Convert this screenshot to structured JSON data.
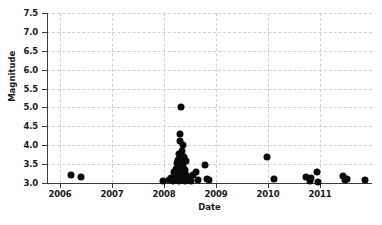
{
  "chart_data": {
    "type": "scatter",
    "title": "",
    "xlabel": "Date",
    "ylabel": "Magnitude",
    "xlim": [
      2005.75,
      2012.0
    ],
    "ylim": [
      3.0,
      7.5
    ],
    "grid": true,
    "legend": null,
    "marker": {
      "shape": "circle",
      "color": "#0a0a0a",
      "size_px": 7
    },
    "x_ticks": [
      {
        "value": 2006,
        "label": "2006"
      },
      {
        "value": 2007,
        "label": "2007"
      },
      {
        "value": 2008,
        "label": "2008"
      },
      {
        "value": 2009,
        "label": "2009"
      },
      {
        "value": 2010,
        "label": "2010"
      },
      {
        "value": 2011,
        "label": "2011"
      }
    ],
    "y_ticks": [
      {
        "value": 3.0,
        "label": "3.0"
      },
      {
        "value": 3.5,
        "label": "3.5"
      },
      {
        "value": 4.0,
        "label": "4.0"
      },
      {
        "value": 4.5,
        "label": "4.5"
      },
      {
        "value": 5.0,
        "label": "5.0"
      },
      {
        "value": 5.5,
        "label": "5.5"
      },
      {
        "value": 6.0,
        "label": "6.0"
      },
      {
        "value": 6.5,
        "label": "6.5"
      },
      {
        "value": 7.0,
        "label": "7.0"
      },
      {
        "value": 7.5,
        "label": "7.5"
      }
    ],
    "points": [
      {
        "x": 2006.22,
        "y": 3.21
      },
      {
        "x": 2006.41,
        "y": 3.17
      },
      {
        "x": 2007.98,
        "y": 3.06
      },
      {
        "x": 2008.09,
        "y": 3.09
      },
      {
        "x": 2008.14,
        "y": 3.12
      },
      {
        "x": 2008.18,
        "y": 3.05
      },
      {
        "x": 2008.2,
        "y": 3.3
      },
      {
        "x": 2008.21,
        "y": 3.18
      },
      {
        "x": 2008.22,
        "y": 3.1
      },
      {
        "x": 2008.23,
        "y": 3.38
      },
      {
        "x": 2008.24,
        "y": 3.07
      },
      {
        "x": 2008.25,
        "y": 3.25
      },
      {
        "x": 2008.25,
        "y": 3.52
      },
      {
        "x": 2008.26,
        "y": 3.14
      },
      {
        "x": 2008.27,
        "y": 3.33
      },
      {
        "x": 2008.27,
        "y": 3.62
      },
      {
        "x": 2008.28,
        "y": 3.06
      },
      {
        "x": 2008.28,
        "y": 3.2
      },
      {
        "x": 2008.29,
        "y": 3.45
      },
      {
        "x": 2008.29,
        "y": 3.78
      },
      {
        "x": 2008.3,
        "y": 3.11
      },
      {
        "x": 2008.3,
        "y": 3.28
      },
      {
        "x": 2008.3,
        "y": 3.55
      },
      {
        "x": 2008.31,
        "y": 4.31
      },
      {
        "x": 2008.31,
        "y": 4.12
      },
      {
        "x": 2008.31,
        "y": 3.16
      },
      {
        "x": 2008.32,
        "y": 3.4
      },
      {
        "x": 2008.32,
        "y": 3.68
      },
      {
        "x": 2008.32,
        "y": 3.09
      },
      {
        "x": 2008.33,
        "y": 5.0
      },
      {
        "x": 2008.33,
        "y": 3.24
      },
      {
        "x": 2008.33,
        "y": 3.5
      },
      {
        "x": 2008.34,
        "y": 3.13
      },
      {
        "x": 2008.34,
        "y": 3.86
      },
      {
        "x": 2008.35,
        "y": 3.31
      },
      {
        "x": 2008.35,
        "y": 3.07
      },
      {
        "x": 2008.36,
        "y": 3.6
      },
      {
        "x": 2008.36,
        "y": 3.19
      },
      {
        "x": 2008.37,
        "y": 4.0
      },
      {
        "x": 2008.37,
        "y": 3.44
      },
      {
        "x": 2008.38,
        "y": 3.1
      },
      {
        "x": 2008.38,
        "y": 3.27
      },
      {
        "x": 2008.39,
        "y": 3.7
      },
      {
        "x": 2008.39,
        "y": 3.15
      },
      {
        "x": 2008.4,
        "y": 3.35
      },
      {
        "x": 2008.41,
        "y": 3.05
      },
      {
        "x": 2008.42,
        "y": 3.22
      },
      {
        "x": 2008.43,
        "y": 3.58
      },
      {
        "x": 2008.44,
        "y": 3.12
      },
      {
        "x": 2008.46,
        "y": 3.08
      },
      {
        "x": 2008.48,
        "y": 3.17
      },
      {
        "x": 2008.52,
        "y": 3.06
      },
      {
        "x": 2008.56,
        "y": 3.21
      },
      {
        "x": 2008.62,
        "y": 3.3
      },
      {
        "x": 2008.66,
        "y": 3.09
      },
      {
        "x": 2008.78,
        "y": 3.47
      },
      {
        "x": 2008.83,
        "y": 3.1
      },
      {
        "x": 2008.86,
        "y": 3.07
      },
      {
        "x": 2009.98,
        "y": 3.7
      },
      {
        "x": 2010.12,
        "y": 3.11
      },
      {
        "x": 2010.74,
        "y": 3.16
      },
      {
        "x": 2010.8,
        "y": 3.05
      },
      {
        "x": 2010.82,
        "y": 3.12
      },
      {
        "x": 2010.94,
        "y": 3.29
      },
      {
        "x": 2010.97,
        "y": 3.03
      },
      {
        "x": 2011.44,
        "y": 3.18
      },
      {
        "x": 2011.48,
        "y": 3.08
      },
      {
        "x": 2011.52,
        "y": 3.1
      },
      {
        "x": 2011.86,
        "y": 3.07
      }
    ]
  }
}
